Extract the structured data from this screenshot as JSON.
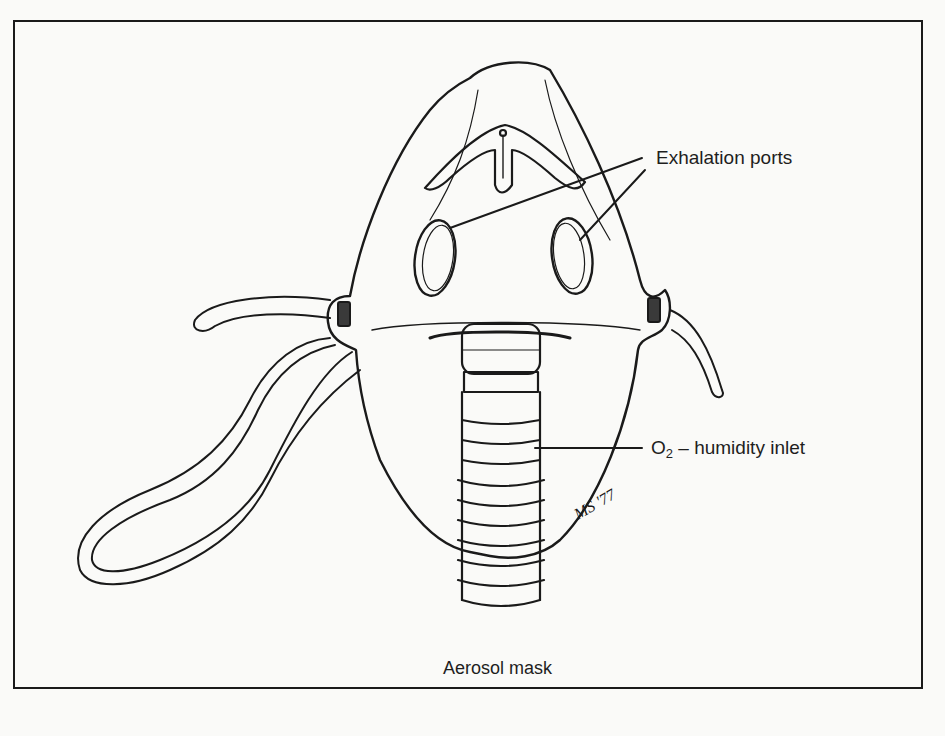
{
  "figure": {
    "caption": "Aerosol mask",
    "signature": "MS '77"
  },
  "labels": {
    "exhalation_ports": "Exhalation ports",
    "inlet_prefix": "O",
    "inlet_subscript": "2",
    "inlet_suffix": " – humidity inlet"
  },
  "colors": {
    "ink": "#1a1a1a",
    "paper": "#fafaf8"
  }
}
